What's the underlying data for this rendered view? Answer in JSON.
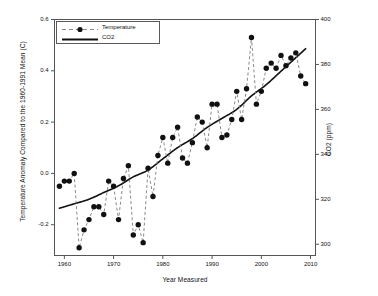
{
  "chart_data": {
    "type": "line",
    "title": "",
    "xlabel": "Year Measured",
    "ylabel": "Temperature Anomaly Compared to the 1960-1991 Mean (C)",
    "y2label": "CO2 (ppm)",
    "xlim": [
      1958,
      2011
    ],
    "ylim": [
      -0.32,
      0.6
    ],
    "y2lim": [
      295,
      400
    ],
    "grid": false,
    "legend_position": "top-left",
    "xticks": [
      "1960",
      "1970",
      "1980",
      "1990",
      "2000",
      "2010"
    ],
    "xtick_values": [
      1960,
      1970,
      1980,
      1990,
      2000,
      2010
    ],
    "yticks": [
      "-0.2",
      "0.0",
      "0.2",
      "0.4",
      "0.6"
    ],
    "ytick_values": [
      -0.2,
      0.0,
      0.2,
      0.4,
      0.6
    ],
    "y2ticks": [
      "300",
      "320",
      "340",
      "360",
      "380",
      "400"
    ],
    "y2tick_values": [
      300,
      320,
      340,
      360,
      380,
      400
    ],
    "series": [
      {
        "name": "Temperature",
        "axis": "left",
        "style": "dashed-with-markers",
        "marker": "filled-circle",
        "color": "#111111",
        "x": [
          1959,
          1960,
          1961,
          1962,
          1963,
          1964,
          1965,
          1966,
          1967,
          1968,
          1969,
          1970,
          1971,
          1972,
          1973,
          1974,
          1975,
          1976,
          1977,
          1978,
          1979,
          1980,
          1981,
          1982,
          1983,
          1984,
          1985,
          1986,
          1987,
          1988,
          1989,
          1990,
          1991,
          1992,
          1993,
          1994,
          1995,
          1996,
          1997,
          1998,
          1999,
          2000,
          2001,
          2002,
          2003,
          2004,
          2005,
          2006,
          2007,
          2008,
          2009
        ],
        "values": [
          -0.05,
          -0.03,
          -0.03,
          0.0,
          -0.29,
          -0.22,
          -0.18,
          -0.13,
          -0.13,
          -0.16,
          -0.03,
          -0.05,
          -0.18,
          -0.02,
          0.03,
          -0.24,
          -0.2,
          -0.27,
          0.02,
          -0.09,
          0.07,
          0.14,
          0.04,
          0.14,
          0.18,
          0.06,
          0.04,
          0.12,
          0.22,
          0.2,
          0.1,
          0.27,
          0.27,
          0.14,
          0.15,
          0.21,
          0.32,
          0.21,
          0.33,
          0.53,
          0.27,
          0.32,
          0.41,
          0.43,
          0.41,
          0.46,
          0.42,
          0.45,
          0.47,
          0.38,
          0.35
        ]
      },
      {
        "name": "CO2",
        "axis": "right",
        "style": "solid",
        "color": "#111111",
        "x": [
          1959,
          1962,
          1965,
          1968,
          1971,
          1974,
          1977,
          1980,
          1983,
          1986,
          1989,
          1992,
          1995,
          1998,
          2001,
          2004,
          2007,
          2009
        ],
        "values": [
          316,
          318,
          320,
          323,
          326,
          330,
          333,
          338,
          343,
          347,
          352,
          356,
          360,
          366,
          371,
          377,
          383,
          387
        ]
      }
    ]
  },
  "legend": {
    "items": [
      {
        "label": "Temperature",
        "marker": "dashed-marker"
      },
      {
        "label": "CO2",
        "marker": "solid-line"
      }
    ]
  }
}
